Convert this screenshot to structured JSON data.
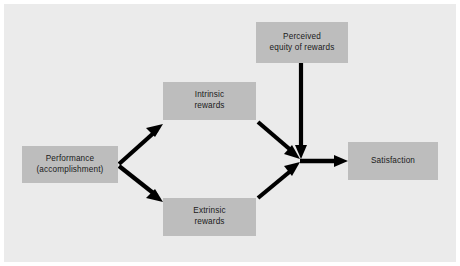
{
  "diagram": {
    "panel_color": "#ebebeb",
    "node_color": "#bdbdbd",
    "arrow_color": "#000000",
    "nodes": [
      {
        "id": "performance",
        "line1": "Performance",
        "line2": "(accomplishment)"
      },
      {
        "id": "intrinsic",
        "line1": "Intrinsic",
        "line2": "rewards"
      },
      {
        "id": "extrinsic",
        "line1": "Extrinsic",
        "line2": "rewards"
      },
      {
        "id": "equity",
        "line1": "Perceived",
        "line2": "equity of rewards"
      },
      {
        "id": "satisfaction",
        "line1": "Satisfaction",
        "line2": ""
      }
    ],
    "edges": [
      {
        "id": "performance-to-intrinsic",
        "from": "performance",
        "to": "intrinsic",
        "style": "arrow"
      },
      {
        "id": "performance-to-extrinsic",
        "from": "performance",
        "to": "extrinsic",
        "style": "arrow"
      },
      {
        "id": "intrinsic-to-junction",
        "from": "intrinsic",
        "to": "junction",
        "style": "arrow"
      },
      {
        "id": "extrinsic-to-junction",
        "from": "extrinsic",
        "to": "junction",
        "style": "arrow"
      },
      {
        "id": "equity-to-junction",
        "from": "equity",
        "to": "junction",
        "style": "arrow"
      },
      {
        "id": "junction-to-satisfaction",
        "from": "junction",
        "to": "satisfaction",
        "style": "arrow"
      }
    ]
  }
}
